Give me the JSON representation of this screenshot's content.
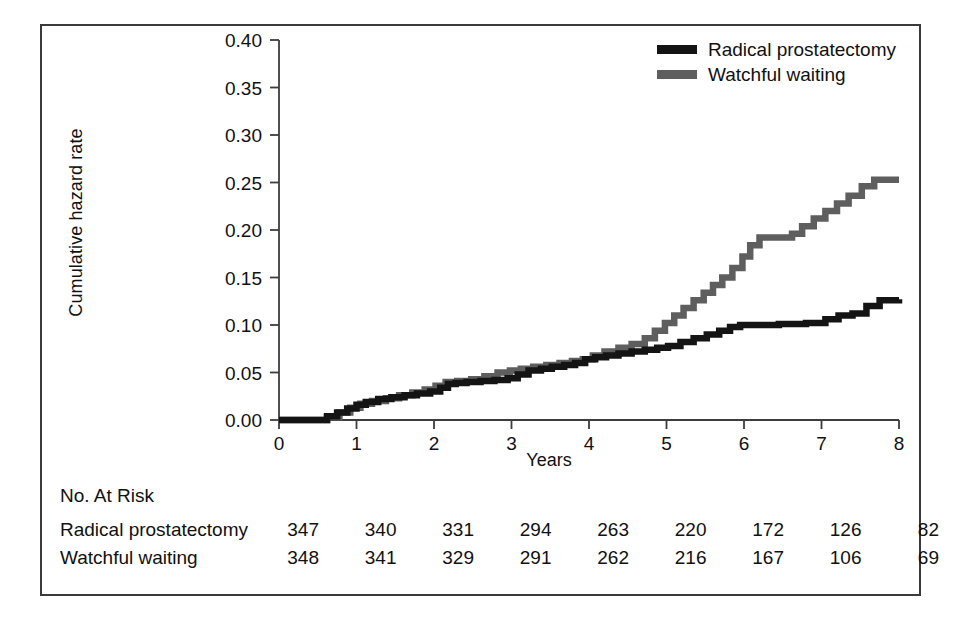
{
  "chart_data": {
    "type": "line",
    "title": "",
    "xlabel": "Years",
    "ylabel": "Cumulative hazard rate",
    "xlim": [
      0,
      8
    ],
    "ylim": [
      0.0,
      0.4
    ],
    "xticks": [
      "0",
      "1",
      "2",
      "3",
      "4",
      "5",
      "6",
      "7",
      "8"
    ],
    "yticks": [
      "0.00",
      "0.05",
      "0.10",
      "0.15",
      "0.20",
      "0.25",
      "0.30",
      "0.35",
      "0.40"
    ],
    "grid": false,
    "legend_position": "top-right",
    "series": [
      {
        "name": "Radical prostatectomy",
        "color": "#141414",
        "step": "post",
        "x": [
          0.0,
          0.3,
          0.62,
          0.75,
          0.88,
          1.0,
          1.12,
          1.28,
          1.45,
          1.62,
          1.78,
          1.95,
          2.08,
          2.18,
          2.28,
          2.42,
          2.6,
          2.78,
          2.95,
          3.08,
          3.22,
          3.38,
          3.52,
          3.68,
          3.82,
          3.95,
          4.08,
          4.22,
          4.38,
          4.55,
          4.72,
          4.88,
          5.02,
          5.18,
          5.35,
          5.52,
          5.68,
          5.82,
          5.95,
          6.1,
          6.45,
          6.8,
          7.05,
          7.22,
          7.4,
          7.58,
          7.75,
          8.0
        ],
        "y": [
          0.0,
          0.0,
          0.004,
          0.008,
          0.012,
          0.016,
          0.019,
          0.022,
          0.024,
          0.026,
          0.028,
          0.03,
          0.034,
          0.038,
          0.039,
          0.04,
          0.041,
          0.042,
          0.044,
          0.048,
          0.052,
          0.054,
          0.056,
          0.058,
          0.06,
          0.064,
          0.066,
          0.068,
          0.07,
          0.072,
          0.074,
          0.076,
          0.078,
          0.082,
          0.086,
          0.09,
          0.094,
          0.098,
          0.1,
          0.1,
          0.101,
          0.102,
          0.106,
          0.11,
          0.112,
          0.12,
          0.126,
          0.127
        ]
      },
      {
        "name": "Watchful waiting",
        "color": "#5e5e5e",
        "step": "post",
        "x": [
          0.0,
          0.3,
          0.62,
          0.78,
          0.92,
          1.05,
          1.2,
          1.38,
          1.55,
          1.72,
          1.88,
          2.02,
          2.15,
          2.3,
          2.48,
          2.65,
          2.82,
          2.98,
          3.12,
          3.28,
          3.45,
          3.62,
          3.78,
          3.92,
          4.05,
          4.2,
          4.38,
          4.55,
          4.72,
          4.85,
          4.98,
          5.1,
          5.22,
          5.35,
          5.48,
          5.6,
          5.72,
          5.85,
          5.98,
          6.08,
          6.2,
          6.5,
          6.62,
          6.75,
          6.9,
          7.05,
          7.2,
          7.35,
          7.52,
          7.68,
          8.0
        ],
        "y": [
          0.0,
          0.0,
          0.003,
          0.008,
          0.013,
          0.017,
          0.02,
          0.023,
          0.026,
          0.029,
          0.032,
          0.036,
          0.04,
          0.041,
          0.043,
          0.046,
          0.05,
          0.052,
          0.054,
          0.056,
          0.058,
          0.06,
          0.062,
          0.064,
          0.068,
          0.072,
          0.076,
          0.08,
          0.086,
          0.094,
          0.102,
          0.11,
          0.118,
          0.126,
          0.134,
          0.142,
          0.15,
          0.16,
          0.172,
          0.184,
          0.192,
          0.192,
          0.196,
          0.204,
          0.212,
          0.22,
          0.228,
          0.236,
          0.246,
          0.253,
          0.253
        ]
      }
    ]
  },
  "legend": {
    "entries": [
      {
        "label": "Radical prostatectomy",
        "color": "#141414"
      },
      {
        "label": "Watchful waiting",
        "color": "#5e5e5e"
      }
    ]
  },
  "axes": {
    "y_title": "Cumulative hazard rate",
    "x_title": "Years"
  },
  "risk_table": {
    "title": "No. At Risk",
    "column_positions": [
      0,
      1,
      2,
      3,
      4,
      5,
      6,
      7,
      8
    ],
    "rows": [
      {
        "label": "Radical prostatectomy",
        "values": [
          "347",
          "340",
          "331",
          "294",
          "263",
          "220",
          "172",
          "126",
          "82"
        ]
      },
      {
        "label": "Watchful waiting",
        "values": [
          "348",
          "341",
          "329",
          "291",
          "262",
          "216",
          "167",
          "106",
          "69"
        ]
      }
    ]
  }
}
